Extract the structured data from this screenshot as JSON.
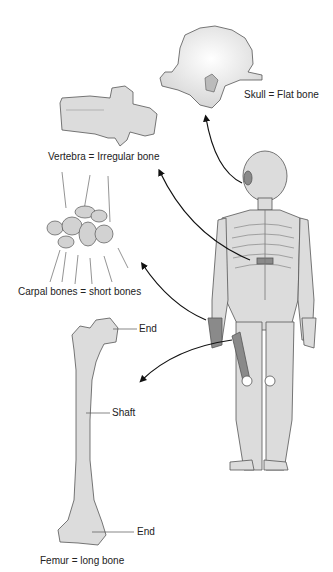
{
  "labels": {
    "skull": "Skull = Flat bone",
    "vertebra": "Vertebra = Irregular bone",
    "carpal": "Carpal bones = short bones",
    "femur": "Femur = long bone",
    "femur_end_top": "End",
    "femur_shaft": "Shaft",
    "femur_end_bottom": "End"
  },
  "colors": {
    "bone_fill": "#dcdcdc",
    "highlight_fill": "#8a8a8a",
    "outline": "#555555",
    "arrow": "#111111"
  }
}
